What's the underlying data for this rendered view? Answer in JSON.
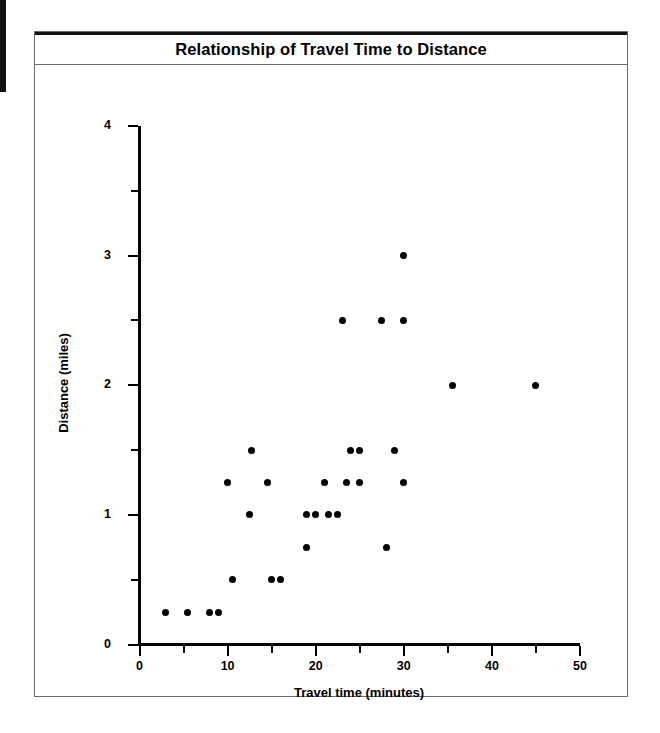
{
  "figure": {
    "title": "Relationship of Travel Time to Distance"
  },
  "axes": {
    "x_title": "Travel time (minutes)",
    "y_title": "Distance (miles)",
    "x_major_labels": [
      "0",
      "10",
      "20",
      "30",
      "40",
      "50"
    ],
    "y_major_labels": [
      "0",
      "1",
      "2",
      "3",
      "4"
    ]
  },
  "colors": {
    "ink": "#000000",
    "frame": "#6b6b6b",
    "background": "#ffffff",
    "marker": "#000000"
  },
  "chart_data": {
    "type": "scatter",
    "title": "Relationship of Travel Time to Distance",
    "xlabel": "Travel time (minutes)",
    "ylabel": "Distance (miles)",
    "xlim": [
      0,
      50
    ],
    "ylim": [
      0,
      4
    ],
    "x_major_ticks": [
      0,
      10,
      20,
      30,
      40,
      50
    ],
    "x_minor_ticks": [
      5,
      15,
      25,
      35,
      45
    ],
    "y_major_ticks": [
      0,
      1,
      2,
      3,
      4
    ],
    "y_minor_ticks": [
      0.5,
      1.5,
      2.5,
      3.5
    ],
    "grid": false,
    "legend": false,
    "marker": "filled-circle",
    "series": [
      {
        "name": "trips",
        "points": [
          [
            3.0,
            0.25
          ],
          [
            5.5,
            0.25
          ],
          [
            8.0,
            0.25
          ],
          [
            9.0,
            0.25
          ],
          [
            10.5,
            0.5
          ],
          [
            15.0,
            0.5
          ],
          [
            16.0,
            0.5
          ],
          [
            19.0,
            0.75
          ],
          [
            28.0,
            0.75
          ],
          [
            12.5,
            1.0
          ],
          [
            19.0,
            1.0
          ],
          [
            20.0,
            1.0
          ],
          [
            21.5,
            1.0
          ],
          [
            22.5,
            1.0
          ],
          [
            10.0,
            1.25
          ],
          [
            14.5,
            1.25
          ],
          [
            21.0,
            1.25
          ],
          [
            23.5,
            1.25
          ],
          [
            25.0,
            1.25
          ],
          [
            30.0,
            1.25
          ],
          [
            12.7,
            1.5
          ],
          [
            24.0,
            1.5
          ],
          [
            25.0,
            1.5
          ],
          [
            29.0,
            1.5
          ],
          [
            35.5,
            2.0
          ],
          [
            45.0,
            2.0
          ],
          [
            23.0,
            2.5
          ],
          [
            27.5,
            2.5
          ],
          [
            30.0,
            2.5
          ],
          [
            30.0,
            3.0
          ]
        ]
      }
    ]
  }
}
